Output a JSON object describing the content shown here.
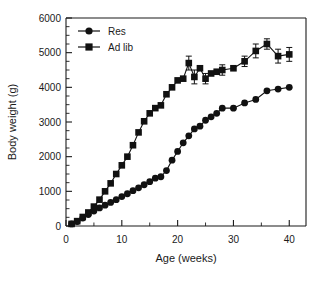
{
  "chart_data": {
    "type": "line",
    "title": "",
    "xlabel": "Age (weeks)",
    "ylabel": "Body weight (g)",
    "xlim": [
      0,
      43
    ],
    "ylim": [
      0,
      6000
    ],
    "xticks": [
      0,
      10,
      20,
      30,
      40
    ],
    "yticks": [
      0,
      1000,
      2000,
      3000,
      4000,
      5000,
      6000
    ],
    "xtick_labels": [
      "0",
      "10",
      "20",
      "30",
      "40"
    ],
    "ytick_labels": [
      "0",
      "1000",
      "2000",
      "3000",
      "4000",
      "5000",
      "6000"
    ],
    "minor_ticks": true,
    "grid": false,
    "legend_position": "top-left-inside",
    "series": [
      {
        "name": "Res",
        "marker": "circle",
        "color": "#111111",
        "x": [
          1,
          2,
          3,
          4,
          5,
          6,
          7,
          8,
          9,
          10,
          11,
          12,
          13,
          14,
          15,
          16,
          17,
          18,
          19,
          20,
          21,
          22,
          23,
          24,
          25,
          26,
          27,
          28,
          30,
          32,
          34,
          36,
          38,
          40
        ],
        "values": [
          60,
          130,
          230,
          330,
          430,
          520,
          600,
          680,
          760,
          850,
          930,
          1020,
          1100,
          1190,
          1280,
          1380,
          1420,
          1600,
          1900,
          2150,
          2400,
          2600,
          2800,
          2880,
          3050,
          3150,
          3250,
          3400,
          3400,
          3550,
          3650,
          3900,
          3950,
          4000
        ],
        "errors": [
          0,
          0,
          0,
          0,
          0,
          0,
          0,
          0,
          0,
          0,
          0,
          0,
          0,
          0,
          0,
          0,
          0,
          0,
          0,
          0,
          0,
          0,
          0,
          0,
          0,
          0,
          0,
          0,
          0,
          0,
          0,
          0,
          0,
          0
        ]
      },
      {
        "name": "Ad lib",
        "marker": "square",
        "color": "#111111",
        "x": [
          1,
          2,
          3,
          4,
          5,
          6,
          7,
          8,
          9,
          10,
          11,
          12,
          13,
          14,
          15,
          16,
          17,
          18,
          19,
          20,
          21,
          22,
          23,
          24,
          25,
          26,
          27,
          28,
          30,
          32,
          34,
          36,
          38,
          40
        ],
        "values": [
          60,
          140,
          260,
          390,
          560,
          760,
          1000,
          1230,
          1500,
          1750,
          2000,
          2330,
          2700,
          3020,
          3250,
          3400,
          3480,
          3800,
          4000,
          4200,
          4250,
          4700,
          4300,
          4550,
          4250,
          4400,
          4450,
          4500,
          4550,
          4750,
          5050,
          5250,
          4900,
          4950
        ],
        "errors": [
          0,
          0,
          0,
          0,
          0,
          0,
          0,
          0,
          0,
          0,
          0,
          0,
          0,
          0,
          0,
          0,
          0,
          0,
          0,
          0,
          0,
          200,
          200,
          0,
          150,
          0,
          0,
          150,
          0,
          150,
          200,
          150,
          200,
          200
        ]
      }
    ]
  },
  "legend": {
    "entries": [
      {
        "label": "Res",
        "marker": "circle"
      },
      {
        "label": "Ad lib",
        "marker": "square"
      }
    ]
  }
}
